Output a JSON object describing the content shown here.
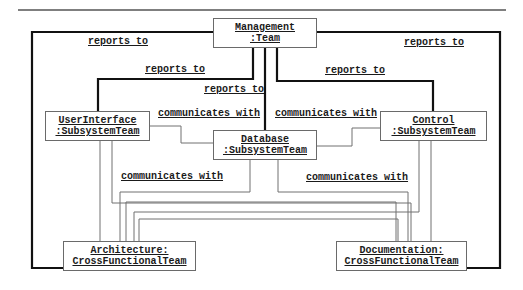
{
  "diagram": {
    "type": "UML object/collaboration diagram",
    "objects": {
      "management": {
        "line1": "Management",
        "line2": ":Team"
      },
      "user_interface": {
        "line1": "UserInterface",
        "line2": ":SubsystemTeam"
      },
      "database": {
        "line1": "Database",
        "line2": ":SubsystemTeam"
      },
      "control": {
        "line1": "Control",
        "line2": ":SubsystemTeam"
      },
      "architecture": {
        "line1": "Architecture:",
        "line2": "CrossFunctionalTeam"
      },
      "documentation": {
        "line1": "Documentation:",
        "line2": "CrossFunctionalTeam"
      }
    },
    "links": {
      "reports_to_architecture": "reports to",
      "reports_to_documentation": "reports to",
      "reports_to_user_interface": "reports to",
      "reports_to_control": "reports to",
      "reports_to_database": "reports to",
      "comm_ui_database": "communicates with",
      "comm_database_control": "communicates with",
      "comm_subsystems_architecture": "communicates with",
      "comm_subsystems_documentation": "communicates with"
    },
    "colors": {
      "thick_line": "#111111",
      "thin_line": "#707070",
      "box_border": "#6a6a6a",
      "rule": "#555555"
    }
  }
}
